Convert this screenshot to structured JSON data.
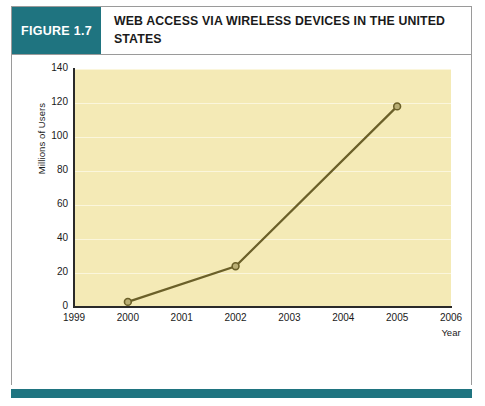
{
  "figure": {
    "badge_label": "FIGURE 1.7",
    "title": "WEB ACCESS VIA WIRELESS DEVICES IN THE UNITED STATES",
    "caption": "",
    "colors": {
      "badge_background": "#1f7480",
      "footer_bar": "#1f7480",
      "plot_background": "#f4eab6",
      "gridline": "#fbf6dc",
      "line": "#6b6029",
      "axis": "#2a2a2a",
      "card_border": "#9a9a9a"
    }
  },
  "chart_data": {
    "type": "line",
    "title": "WEB ACCESS VIA WIRELESS DEVICES IN THE UNITED STATES",
    "xlabel": "Year",
    "ylabel": "Millions of Users",
    "x": [
      2000,
      2002,
      2005
    ],
    "values": [
      3,
      24,
      118
    ],
    "series": [
      {
        "name": "Web access via wireless devices",
        "x": [
          2000,
          2002,
          2005
        ],
        "values": [
          3,
          24,
          118
        ]
      }
    ],
    "xlim": [
      1999,
      2006
    ],
    "ylim": [
      0,
      140
    ],
    "xticks": [
      "1999",
      "2000",
      "2001",
      "2002",
      "2003",
      "2004",
      "2005",
      "2006"
    ],
    "yticks": [
      "0",
      "20",
      "40",
      "60",
      "80",
      "100",
      "120",
      "140"
    ],
    "grid": true,
    "legend": false,
    "markers": true
  }
}
